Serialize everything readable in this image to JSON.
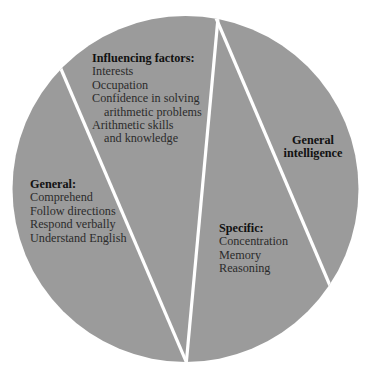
{
  "diagram": {
    "type": "pie-like partition diagram",
    "colors": {
      "fill": "#9b9b9b",
      "divider": "#ffffff",
      "text": "#2b2b2b",
      "heading": "#111111",
      "background": "#ffffff"
    },
    "segments": [
      {
        "id": "general",
        "heading": "General:",
        "items": [
          "Comprehend",
          "Follow directions",
          "Respond verbally",
          "Understand English"
        ]
      },
      {
        "id": "influencing-factors",
        "heading": "Influencing factors:",
        "items": [
          {
            "text": "Interests",
            "indent": false
          },
          {
            "text": "Occupation",
            "indent": false
          },
          {
            "text": "Confidence in solving",
            "indent": false
          },
          {
            "text": "arithmetic problems",
            "indent": true
          },
          {
            "text": "Arithmetic skills",
            "indent": false
          },
          {
            "text": "and knowledge",
            "indent": true
          }
        ]
      },
      {
        "id": "specific",
        "heading": "Specific:",
        "items": [
          "Concentration",
          "Memory",
          "Reasoning"
        ]
      },
      {
        "id": "general-intelligence",
        "heading_lines": [
          "General",
          "intelligence"
        ]
      }
    ]
  }
}
